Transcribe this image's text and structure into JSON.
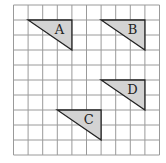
{
  "grid": {
    "cols": 10,
    "rows": 10,
    "origin_x": 13.5,
    "origin_y": 5,
    "cell_w": 14.6,
    "cell_h": 15,
    "line_color": "#9a9a9a",
    "border_color": "#8a8a8a"
  },
  "triangle_style": {
    "fill": "#d3d3d3",
    "stroke": "#222222"
  },
  "triangles": [
    {
      "label": "A",
      "points": [
        [
          1,
          1
        ],
        [
          4,
          1
        ],
        [
          4,
          3
        ]
      ]
    },
    {
      "label": "B",
      "points": [
        [
          6,
          1
        ],
        [
          9,
          1
        ],
        [
          9,
          3
        ]
      ]
    },
    {
      "label": "D",
      "points": [
        [
          6,
          5
        ],
        [
          9,
          5
        ],
        [
          9,
          7
        ]
      ]
    },
    {
      "label": "C",
      "points": [
        [
          3,
          7
        ],
        [
          6,
          7
        ],
        [
          6,
          9
        ]
      ]
    }
  ]
}
